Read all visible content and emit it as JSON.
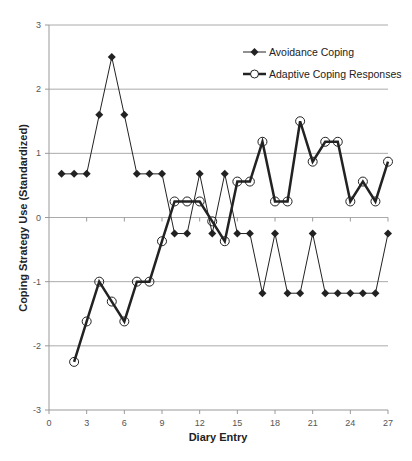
{
  "chart_data": {
    "type": "line",
    "title": "",
    "xlabel": "Diary Entry",
    "ylabel": "Coping Strategy Use (Standardized)",
    "xlim": [
      0,
      27
    ],
    "ylim": [
      -3,
      3
    ],
    "x_ticks": [
      0,
      3,
      6,
      9,
      12,
      15,
      18,
      21,
      24,
      27
    ],
    "y_ticks": [
      3,
      2,
      1,
      0,
      -1,
      -2,
      -3
    ],
    "grid": "horizontal",
    "legend_position": "upper right",
    "series": [
      {
        "name": "Avoidance Coping",
        "marker": "diamond",
        "line_width": 1,
        "x": [
          1,
          2,
          3,
          4,
          5,
          6,
          7,
          8,
          9,
          10,
          11,
          12,
          13,
          14,
          15,
          16,
          17,
          18,
          19,
          20,
          21,
          22,
          23,
          24,
          25,
          26,
          27
        ],
        "values": [
          0.68,
          0.68,
          0.68,
          1.6,
          2.5,
          1.6,
          0.68,
          0.68,
          0.68,
          -0.25,
          -0.25,
          0.68,
          -0.25,
          0.68,
          -0.25,
          -0.25,
          -1.18,
          -0.25,
          -1.18,
          -1.18,
          -0.25,
          -1.18,
          -1.18,
          -1.18,
          -1.18,
          -1.18,
          -0.25
        ]
      },
      {
        "name": "Adaptive Coping Responses",
        "marker": "open-circle",
        "line_width": 2.5,
        "x": [
          2,
          3,
          4,
          5,
          6,
          7,
          8,
          9,
          10,
          11,
          12,
          13,
          14,
          15,
          16,
          17,
          18,
          19,
          20,
          21,
          22,
          23,
          24,
          25,
          26,
          27
        ],
        "values": [
          -2.25,
          -1.62,
          -1.0,
          -1.31,
          -1.62,
          -1.0,
          -1.0,
          -0.37,
          0.25,
          0.25,
          0.25,
          -0.06,
          -0.37,
          0.56,
          0.56,
          1.18,
          0.25,
          0.25,
          1.5,
          0.87,
          1.18,
          1.18,
          0.25,
          0.56,
          0.25,
          0.87
        ]
      }
    ]
  },
  "colors": {
    "line": "#222222",
    "grid": "#aaaaaa",
    "axis": "#999999",
    "background": "#ffffff"
  }
}
